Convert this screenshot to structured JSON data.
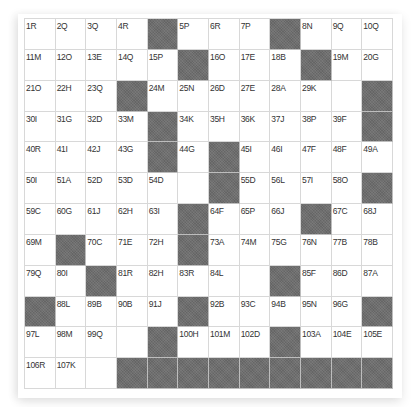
{
  "puzzle": {
    "rows": 12,
    "cols": 12,
    "colors": {
      "cell_bg": "#ffffff",
      "block": "#6e6e6e",
      "grid_line": "#d8d8d8",
      "label": "#333333"
    },
    "grid": [
      [
        "1R",
        "2Q",
        "3Q",
        "4R",
        "#",
        "5P",
        "6R",
        "7P",
        "#",
        "8N",
        "9Q",
        "10Q"
      ],
      [
        "11M",
        "12O",
        "13E",
        "14Q",
        "15P",
        "#",
        "16O",
        "17E",
        "18B",
        "#",
        "19M",
        "20G"
      ],
      [
        "21O",
        "22H",
        "23Q",
        "#",
        "24M",
        "25N",
        "26D",
        "27E",
        "28A",
        "29K",
        "",
        "#"
      ],
      [
        "30I",
        "31G",
        "32D",
        "33M",
        "#",
        "34K",
        "35H",
        "36K",
        "37J",
        "38P",
        "39F",
        "#"
      ],
      [
        "40R",
        "41I",
        "42J",
        "43G",
        "#",
        "44G",
        "#",
        "45I",
        "46I",
        "47F",
        "48F",
        "49A"
      ],
      [
        "50I",
        "51A",
        "52D",
        "53D",
        "54D",
        "",
        "#",
        "55D",
        "56L",
        "57I",
        "58O",
        "#"
      ],
      [
        "59C",
        "60G",
        "61J",
        "62H",
        "63I",
        "#",
        "64F",
        "65P",
        "66J",
        "#",
        "67C",
        "68J"
      ],
      [
        "69M",
        "#",
        "70C",
        "71E",
        "72H",
        "#",
        "73A",
        "74M",
        "75G",
        "76N",
        "77B",
        "78B"
      ],
      [
        "79Q",
        "80I",
        "#",
        "81R",
        "82H",
        "83R",
        "84L",
        "",
        "#",
        "85F",
        "86D",
        "87A"
      ],
      [
        "#",
        "88L",
        "89B",
        "90B",
        "91J",
        "#",
        "92B",
        "93C",
        "94B",
        "95N",
        "96G",
        "#"
      ],
      [
        "97L",
        "98M",
        "99Q",
        "",
        "#",
        "100H",
        "101M",
        "102D",
        "#",
        "103A",
        "104E",
        "105E"
      ],
      [
        "106R",
        "107K",
        "",
        "#",
        "#",
        "#",
        "#",
        "#",
        "#",
        "#",
        "#",
        "#"
      ]
    ]
  }
}
